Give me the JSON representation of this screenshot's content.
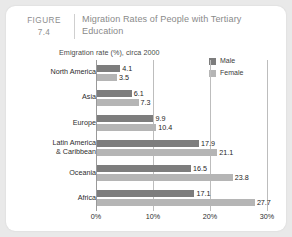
{
  "figure": {
    "label_word": "FIGURE",
    "label_number": "7.4",
    "title": "Migration Rates of People with Tertiary Education"
  },
  "chart_data": {
    "type": "bar",
    "orientation": "horizontal",
    "title": "Migration Rates of People with Tertiary Education",
    "subtitle": "Emigration rate (%), circa 2000",
    "xlabel": "",
    "ylabel": "",
    "xlim": [
      0,
      30
    ],
    "xticks": [
      "0%",
      "10%",
      "20%",
      "30%"
    ],
    "xtick_values": [
      0,
      10,
      20,
      30
    ],
    "grid": true,
    "legend_position": "top-right",
    "categories": [
      "North America",
      "Asia",
      "Europe",
      "Latin America & Caribbean",
      "Oceania",
      "Africa"
    ],
    "series": [
      {
        "name": "Male",
        "color": "#7d7d7d",
        "values": [
          4.1,
          6.1,
          9.9,
          17.9,
          16.5,
          17.1
        ],
        "labels": [
          "4.1",
          "6.1",
          "9.9",
          "17.9",
          "16.5",
          "17.1"
        ]
      },
      {
        "name": "Female",
        "color": "#b5b5b5",
        "values": [
          3.5,
          7.3,
          10.4,
          21.1,
          23.8,
          27.7
        ],
        "labels": [
          "3.5",
          "7.3",
          "10.4",
          "21.1",
          "23.8",
          "27.7"
        ]
      }
    ]
  },
  "categories_display": [
    {
      "line1": "North America",
      "line2": ""
    },
    {
      "line1": "Asia",
      "line2": ""
    },
    {
      "line1": "Europe",
      "line2": ""
    },
    {
      "line1": "Latin America",
      "line2": "& Caribbean"
    },
    {
      "line1": "Oceania",
      "line2": ""
    },
    {
      "line1": "Africa",
      "line2": ""
    }
  ],
  "colors": {
    "page_background": "#e9e9e9",
    "card_background": "#ffffff",
    "male_bar": "#7d7d7d",
    "female_bar": "#b5b5b5",
    "gridline": "#bdbdbd",
    "axis": "#9a9a9a",
    "header_text": "#8a8a8a"
  }
}
